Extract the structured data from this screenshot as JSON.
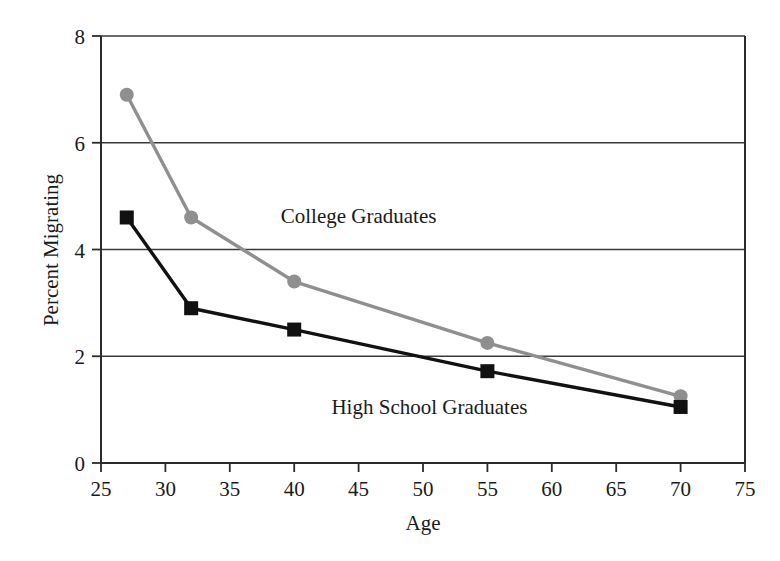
{
  "chart_data": {
    "type": "line",
    "title": "",
    "xlabel": "Age",
    "ylabel": "Percent Migrating",
    "xlim": [
      25,
      75
    ],
    "ylim": [
      0,
      8
    ],
    "xticks": [
      25,
      30,
      35,
      40,
      45,
      50,
      55,
      60,
      65,
      70,
      75
    ],
    "yticks": [
      0,
      2,
      4,
      6,
      8
    ],
    "xtick_labels": [
      "25",
      "30",
      "35",
      "40",
      "45",
      "50",
      "55",
      "60",
      "65",
      "70",
      "75"
    ],
    "ytick_labels": [
      "0",
      "2",
      "4",
      "6",
      "8"
    ],
    "grid": "horizontal",
    "legend_position": "inline-annotations",
    "x": [
      27,
      32,
      40,
      55,
      70
    ],
    "series": [
      {
        "name": "College Graduates",
        "values": [
          6.9,
          4.6,
          3.4,
          2.25,
          1.25
        ],
        "color": "#8f8f8f",
        "marker": "circle",
        "label_x": 45,
        "label_y": 4.62
      },
      {
        "name": "High School Graduates",
        "values": [
          4.6,
          2.9,
          2.5,
          1.72,
          1.05
        ],
        "color": "#111111",
        "marker": "square",
        "label_x": 50.5,
        "label_y": 1.05
      }
    ]
  },
  "axes": {
    "frame_color": "#2b2b2b",
    "gridline_color": "#3a3a3a"
  }
}
